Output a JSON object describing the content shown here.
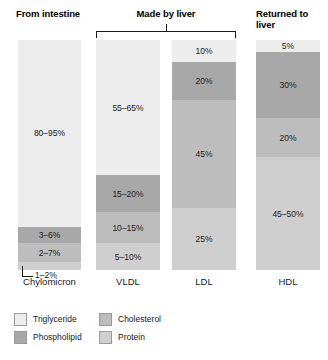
{
  "colors": {
    "triglyceride": "#ededed",
    "phospholipid": "#a8a8a8",
    "cholesterol": "#bdbdbd",
    "protein": "#cfcfcf",
    "line": "#1a1a1a",
    "background": "#ffffff"
  },
  "groups": {
    "intestine": "From intestine",
    "liver": "Made by liver",
    "returned": "Returned to liver"
  },
  "legend": [
    {
      "key": "triglyceride",
      "label": "Triglyceride",
      "color": "#ededed"
    },
    {
      "key": "cholesterol",
      "label": "Cholesterol",
      "color": "#bdbdbd"
    },
    {
      "key": "phospholipid",
      "label": "Phospholipid",
      "color": "#a8a8a8"
    },
    {
      "key": "protein",
      "label": "Protein",
      "color": "#cfcfcf"
    }
  ],
  "chart_data": {
    "type": "bar",
    "xlabel": "",
    "ylabel": "Percent composition",
    "ylim": [
      0,
      100
    ],
    "grid": false,
    "legend_position": "bottom-left",
    "stacked": true,
    "categories": [
      "Chylomicron",
      "VLDL",
      "LDL",
      "HDL"
    ],
    "groups": [
      "From intestine",
      "Made by liver",
      "Made by liver",
      "Returned to liver"
    ],
    "series": [
      {
        "name": "Triglyceride",
        "color": "#ededed",
        "labels": [
          "80–95%",
          "55–65%",
          "10%",
          "5%"
        ],
        "values": [
          87.5,
          60,
          10,
          5
        ]
      },
      {
        "name": "Phospholipid",
        "color": "#a8a8a8",
        "labels": [
          "3–6%",
          "15–20%",
          "20%",
          "30%"
        ],
        "values": [
          4.5,
          17.5,
          20,
          30
        ]
      },
      {
        "name": "Cholesterol",
        "color": "#bdbdbd",
        "labels": [
          "2–7%",
          "10–15%",
          "45%",
          "20%"
        ],
        "values": [
          4.5,
          12.5,
          45,
          20
        ]
      },
      {
        "name": "Protein",
        "color": "#cfcfcf",
        "labels": [
          "1–2%",
          "5–10%",
          "25%",
          "45–50%"
        ],
        "values": [
          1.5,
          7.5,
          25,
          47.5
        ]
      }
    ]
  },
  "columns": [
    {
      "name": "Chylomicron",
      "segments": [
        {
          "component": "Triglyceride",
          "label": "80–95%",
          "color": "#ededed",
          "height_pct": 81.3,
          "label_visible": true
        },
        {
          "component": "Phospholipid",
          "label": "3–6%",
          "color": "#a8a8a8",
          "height_pct": 7.0,
          "label_visible": true
        },
        {
          "component": "Cholesterol",
          "label": "2–7%",
          "color": "#bdbdbd",
          "height_pct": 8.3,
          "label_visible": true
        },
        {
          "component": "Protein",
          "label": "1–2%",
          "color": "#cfcfcf",
          "height_pct": 3.4,
          "label_visible": false
        }
      ],
      "callout": "1–2%"
    },
    {
      "name": "VLDL",
      "segments": [
        {
          "component": "Triglyceride",
          "label": "55–65%",
          "color": "#ededed",
          "height_pct": 58.7,
          "label_visible": true
        },
        {
          "component": "Phospholipid",
          "label": "15–20%",
          "color": "#a8a8a8",
          "height_pct": 16.1,
          "label_visible": true
        },
        {
          "component": "Cholesterol",
          "label": "10–15%",
          "color": "#bdbdbd",
          "height_pct": 13.5,
          "label_visible": true
        },
        {
          "component": "Protein",
          "label": "5–10%",
          "color": "#cfcfcf",
          "height_pct": 11.7,
          "label_visible": true
        }
      ],
      "callout": null
    },
    {
      "name": "LDL",
      "segments": [
        {
          "component": "Triglyceride",
          "label": "10%",
          "color": "#ededed",
          "height_pct": 9.6,
          "label_visible": true
        },
        {
          "component": "Phospholipid",
          "label": "20%",
          "color": "#a8a8a8",
          "height_pct": 16.5,
          "label_visible": true
        },
        {
          "component": "Cholesterol",
          "label": "45%",
          "color": "#bdbdbd",
          "height_pct": 47.0,
          "label_visible": true
        },
        {
          "component": "Protein",
          "label": "25%",
          "color": "#cfcfcf",
          "height_pct": 26.9,
          "label_visible": true
        }
      ],
      "callout": null
    },
    {
      "name": "HDL",
      "segments": [
        {
          "component": "Triglyceride",
          "label": "5%",
          "color": "#ededed",
          "height_pct": 5.2,
          "label_visible": true
        },
        {
          "component": "Phospholipid",
          "label": "30%",
          "color": "#a8a8a8",
          "height_pct": 28.7,
          "label_visible": true
        },
        {
          "component": "Cholesterol",
          "label": "20%",
          "color": "#bdbdbd",
          "height_pct": 17.0,
          "label_visible": true
        },
        {
          "component": "Protein",
          "label": "45–50%",
          "color": "#cfcfcf",
          "height_pct": 49.1,
          "label_visible": true
        }
      ],
      "callout": null
    }
  ]
}
